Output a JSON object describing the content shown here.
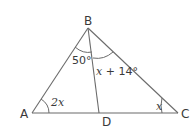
{
  "diagram": {
    "type": "triangle-with-cevian",
    "points": {
      "A": {
        "label": "A"
      },
      "B": {
        "label": "B"
      },
      "C": {
        "label": "C"
      },
      "D": {
        "label": "D"
      }
    },
    "segments": [
      "AB",
      "BC",
      "CA",
      "BD"
    ],
    "angles": {
      "ABD": {
        "label": "50°"
      },
      "DBC": {
        "label_var": "x",
        "label_rest": " + 14°"
      },
      "BAC": {
        "label": "2x"
      },
      "BCA": {
        "label": "x"
      }
    }
  }
}
